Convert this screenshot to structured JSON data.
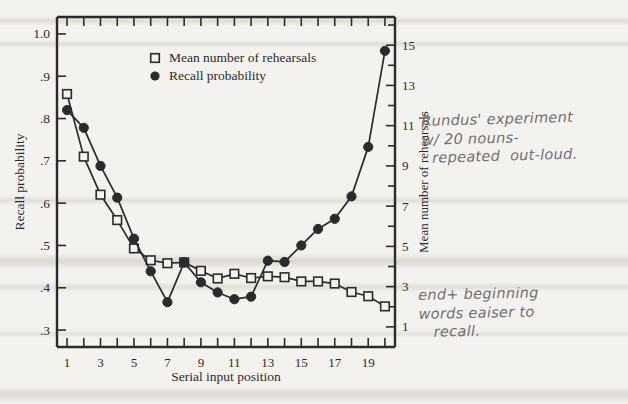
{
  "chart_data": {
    "type": "line",
    "title": "",
    "xlabel": "Serial input position",
    "ylabel": "Recall probability",
    "y2label": "Mean number of rehearsals",
    "xlim": [
      0.4,
      20.6
    ],
    "xticks": [
      1,
      2,
      3,
      4,
      5,
      6,
      7,
      8,
      9,
      10,
      11,
      12,
      13,
      14,
      15,
      16,
      17,
      18,
      19,
      20
    ],
    "xticklabels": [
      "1",
      "",
      "3",
      "",
      "5",
      "",
      "7",
      "",
      "9",
      "",
      "11",
      "",
      "13",
      "",
      "15",
      "",
      "17",
      "",
      "19",
      ""
    ],
    "ylim": [
      0.26,
      1.04
    ],
    "yticks": [
      0.3,
      0.4,
      0.5,
      0.6,
      0.7,
      0.8,
      0.9,
      1.0
    ],
    "yticklabels": [
      ".3",
      ".4",
      ".5",
      ".6",
      ".7",
      ".8",
      ".9",
      "1.0"
    ],
    "y2lim": [
      0.0,
      16.4
    ],
    "y2ticks": [
      1,
      2,
      3,
      4,
      5,
      6,
      7,
      8,
      9,
      10,
      11,
      12,
      13,
      14,
      15,
      16
    ],
    "y2ticklabels": [
      "1",
      "",
      "3",
      "",
      "5",
      "",
      "7",
      "",
      "9",
      "",
      "11",
      "",
      "13",
      "",
      "15",
      ""
    ],
    "grid": false,
    "legend_position": "upper center",
    "x": [
      1,
      2,
      3,
      4,
      5,
      6,
      7,
      8,
      9,
      10,
      11,
      12,
      13,
      14,
      15,
      16,
      17,
      18,
      19,
      20
    ],
    "series": [
      {
        "name": "Mean number of rehearsals",
        "marker": "open-square",
        "axis": "right",
        "values": [
          12.2,
          9.1,
          7.4,
          6.2,
          4.8,
          4.1,
          3.95,
          3.85,
          3.55,
          3.3,
          3.45,
          3.3,
          3.4,
          3.35,
          3.2,
          3.2,
          3.1,
          2.75,
          2.6,
          2.15
        ],
        "values_left_scale": [
          0.858,
          0.71,
          0.62,
          0.56,
          0.493,
          0.465,
          0.458,
          0.46,
          0.44,
          0.422,
          0.433,
          0.423,
          0.427,
          0.425,
          0.415,
          0.415,
          0.41,
          0.39,
          0.38,
          0.356
        ]
      },
      {
        "name": "Recall probability",
        "marker": "filled-circle",
        "axis": "left",
        "values": [
          0.82,
          0.778,
          0.688,
          0.613,
          0.516,
          0.439,
          0.366,
          0.46,
          0.413,
          0.389,
          0.373,
          0.379,
          0.464,
          0.461,
          0.5,
          0.539,
          0.563,
          0.616,
          0.733,
          0.96
        ]
      }
    ],
    "legend": [
      {
        "label": "Mean number of rehearsals",
        "marker": "open-square"
      },
      {
        "label": "Recall probability",
        "marker": "filled-circle"
      }
    ]
  },
  "annotations": {
    "note_1": "Rundus' experiment\nw/ 20 nouns-\n  repeated  out-loud.",
    "note_2": "end+ beginning\nwords eaiser to\n   recall."
  },
  "colors": {
    "ink": "#2b2b2b",
    "paper": "#f4f2ee",
    "pencil": "#6f6f72"
  }
}
